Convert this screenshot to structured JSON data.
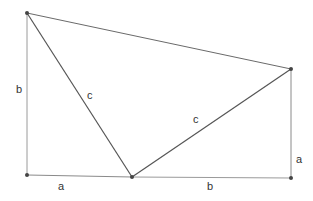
{
  "diagram": {
    "colors": {
      "background": "#ffffff",
      "outer_line": "#9a9a9a",
      "triangle_line": "#555555",
      "point": "#444444",
      "label": "#333333"
    },
    "points": {
      "top_left": {
        "x": 27,
        "y": 13
      },
      "right_top": {
        "x": 291,
        "y": 69
      },
      "bottom_mid": {
        "x": 132,
        "y": 177
      },
      "bottom_left": {
        "x": 27,
        "y": 175
      },
      "bottom_right": {
        "x": 291,
        "y": 178
      }
    },
    "labels": {
      "left_side": "b",
      "upper_hypotenuse": "c",
      "lower_hypotenuse": "c",
      "right_side": "a",
      "bottom_left_segment": "a",
      "bottom_right_segment": "b"
    }
  }
}
